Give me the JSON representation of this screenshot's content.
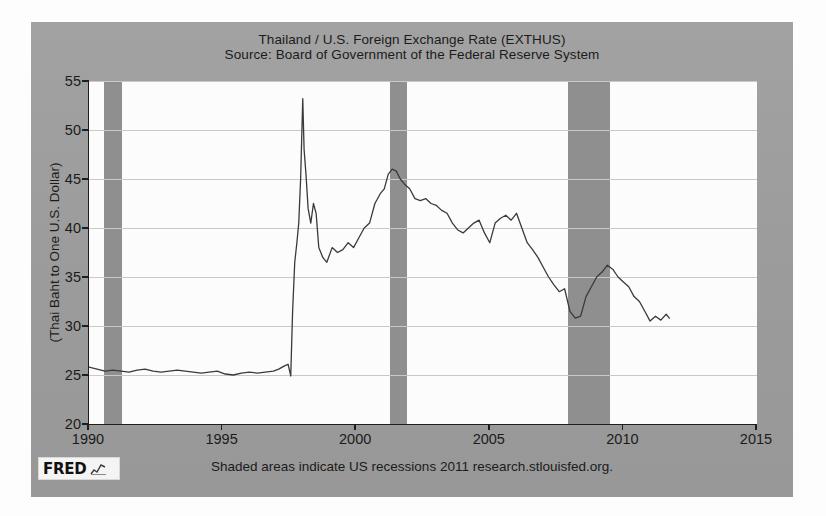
{
  "chart_data": {
    "type": "line",
    "title": "Thailand / U.S. Foreign Exchange Rate (EXTHUS)",
    "subtitle": "Source: Board of Government of the Federal Reserve System",
    "xlabel": "",
    "ylabel": "(Thai Baht to One U.S. Dollar)",
    "xlim": [
      1990,
      2015
    ],
    "ylim": [
      20,
      55
    ],
    "xticks": [
      1990,
      1995,
      2000,
      2005,
      2010,
      2015
    ],
    "yticks": [
      20,
      25,
      30,
      35,
      40,
      45,
      50,
      55
    ],
    "grid": true,
    "legend": "none",
    "line_color": "#3a3a3a",
    "plot_bg": "#fcfcfc",
    "panel_bg": "#9d9d9d",
    "recession_color": "#8f8f8f",
    "annotations": [
      "Shaded areas indicate US recessions"
    ],
    "recessions": [
      {
        "start": 1990.58,
        "end": 1991.25
      },
      {
        "start": 2001.25,
        "end": 2001.92
      },
      {
        "start": 2007.92,
        "end": 2009.5
      }
    ],
    "series": [
      {
        "name": "EXTHUS",
        "x": [
          1990.0,
          1990.3,
          1990.6,
          1990.9,
          1991.2,
          1991.5,
          1991.8,
          1992.1,
          1992.4,
          1992.7,
          1993.0,
          1993.3,
          1993.6,
          1993.9,
          1994.2,
          1994.5,
          1994.8,
          1995.1,
          1995.4,
          1995.7,
          1996.0,
          1996.3,
          1996.6,
          1996.9,
          1997.1,
          1997.3,
          1997.45,
          1997.55,
          1997.62,
          1997.7,
          1997.78,
          1997.85,
          1997.92,
          1998.0,
          1998.05,
          1998.12,
          1998.2,
          1998.3,
          1998.4,
          1998.5,
          1998.6,
          1998.75,
          1998.9,
          1999.1,
          1999.3,
          1999.5,
          1999.7,
          1999.9,
          2000.1,
          2000.3,
          2000.5,
          2000.7,
          2000.9,
          2001.05,
          2001.2,
          2001.35,
          2001.5,
          2001.65,
          2001.8,
          2002.0,
          2002.2,
          2002.4,
          2002.6,
          2002.8,
          2003.0,
          2003.2,
          2003.4,
          2003.6,
          2003.8,
          2004.0,
          2004.2,
          2004.4,
          2004.6,
          2004.8,
          2005.0,
          2005.2,
          2005.4,
          2005.6,
          2005.8,
          2006.0,
          2006.2,
          2006.4,
          2006.6,
          2006.8,
          2007.0,
          2007.2,
          2007.4,
          2007.6,
          2007.8,
          2008.0,
          2008.2,
          2008.4,
          2008.6,
          2008.8,
          2009.0,
          2009.2,
          2009.4,
          2009.6,
          2009.8,
          2010.0,
          2010.2,
          2010.4,
          2010.6,
          2010.8,
          2011.0,
          2011.2,
          2011.4,
          2011.6,
          2011.72
        ],
        "values": [
          25.8,
          25.6,
          25.4,
          25.5,
          25.4,
          25.3,
          25.5,
          25.6,
          25.4,
          25.3,
          25.4,
          25.5,
          25.4,
          25.3,
          25.2,
          25.3,
          25.4,
          25.1,
          25.0,
          25.2,
          25.3,
          25.2,
          25.3,
          25.4,
          25.6,
          25.9,
          26.1,
          24.9,
          31.5,
          36.5,
          38.5,
          40.5,
          45.0,
          53.2,
          48.0,
          45.5,
          42.0,
          40.5,
          42.5,
          41.5,
          38.0,
          37.0,
          36.5,
          38.0,
          37.5,
          37.8,
          38.5,
          38.0,
          39.0,
          40.0,
          40.5,
          42.5,
          43.5,
          44.0,
          45.5,
          46.0,
          45.8,
          45.0,
          44.5,
          44.0,
          43.0,
          42.8,
          43.0,
          42.5,
          42.3,
          41.8,
          41.5,
          40.5,
          39.8,
          39.5,
          40.0,
          40.5,
          40.8,
          39.5,
          38.5,
          40.5,
          41.0,
          41.3,
          40.8,
          41.5,
          40.0,
          38.5,
          37.8,
          37.0,
          36.0,
          35.0,
          34.2,
          33.5,
          33.8,
          31.5,
          30.8,
          31.0,
          33.0,
          34.0,
          35.0,
          35.5,
          36.2,
          35.8,
          35.0,
          34.5,
          34.0,
          33.0,
          32.5,
          31.5,
          30.5,
          31.0,
          30.6,
          31.2,
          30.8
        ]
      }
    ]
  },
  "footer": {
    "logo_text": "FRED",
    "note": "Shaded areas indicate US recessions 2011 research.stlouisfed.org."
  }
}
